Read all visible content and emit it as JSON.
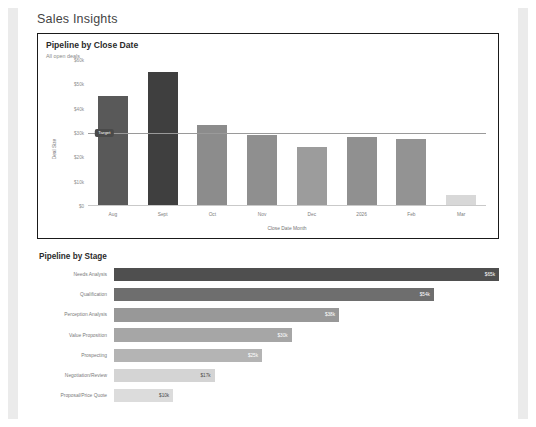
{
  "page": {
    "title": "Sales Insights"
  },
  "card_close_date": {
    "title": "Pipeline by Close Date",
    "subtitle": "All open deals",
    "target_label": "Target"
  },
  "card_stage": {
    "title": "Pipeline by Stage"
  },
  "colors": {
    "panel_border": "#1a1a1a",
    "page_background": "#ffffff",
    "edge_strip": "#ebebeb",
    "target_badge": "#4a4a4a",
    "target_line": "#9a9a9a",
    "axis_text": "#8d8d8d"
  },
  "chart_data": [
    {
      "type": "bar",
      "title": "Pipeline by Close Date",
      "subtitle": "All open deals",
      "xlabel": "Close Date Month",
      "ylabel": "Deal Size",
      "ylim": [
        0,
        60000
      ],
      "ytick_labels": [
        "$60k",
        "$50k",
        "$40k",
        "$30k",
        "$20k",
        "$10k",
        "$0"
      ],
      "ytick_values": [
        60000,
        50000,
        40000,
        30000,
        20000,
        10000,
        0
      ],
      "grid": false,
      "legend": "none",
      "categories": [
        "Aug",
        "Sept",
        "Oct",
        "Nov",
        "Dec",
        "2026",
        "Feb",
        "Mar"
      ],
      "values": [
        45000,
        55000,
        33000,
        29000,
        24000,
        28000,
        27500,
        4000
      ],
      "bar_colors": [
        "#595959",
        "#3f3f3f",
        "#8c8c8c",
        "#8f8f8f",
        "#9c9c9c",
        "#909090",
        "#939393",
        "#d8d8d8"
      ],
      "annotations": [
        {
          "name": "target",
          "label": "Target",
          "value": 30000,
          "type": "reference-line"
        }
      ]
    },
    {
      "type": "bar",
      "orientation": "horizontal",
      "title": "Pipeline by Stage",
      "xlabel": "",
      "ylabel": "",
      "grid": false,
      "legend": "none",
      "categories": [
        "Needs Analysis",
        "Qualification",
        "Perception Analysis",
        "Value Proposition",
        "Prospecting",
        "Negotiation/Review",
        "Proposal/Price Quote"
      ],
      "values": [
        65000,
        54000,
        38000,
        30000,
        25000,
        17000,
        10000
      ],
      "value_labels": [
        "$65k",
        "$54k",
        "$38k",
        "$30k",
        "$25k",
        "$17k",
        "$10k"
      ],
      "bar_colors": [
        "#4f4f4f",
        "#6e6e6e",
        "#989898",
        "#a6a6a6",
        "#b4b4b4",
        "#d4d4d4",
        "#dcdcdc"
      ],
      "label_color_dark_index": [
        5,
        6
      ],
      "xlim": [
        0,
        65000
      ]
    }
  ]
}
